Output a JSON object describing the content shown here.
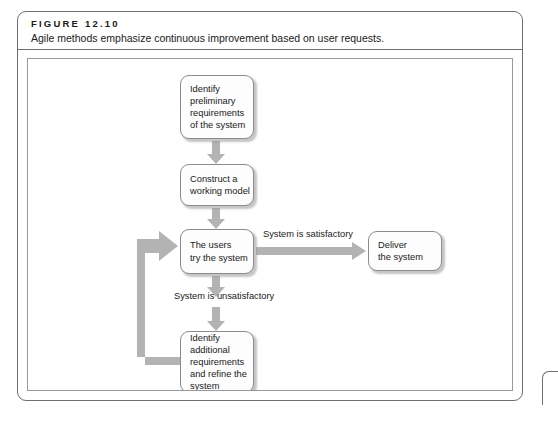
{
  "figure": {
    "number": "FIGURE 12.10",
    "caption": "Agile methods emphasize continuous improvement based on user requests."
  },
  "colors": {
    "frame_border": "#6e6e6e",
    "canvas_border": "#9a9a9a",
    "node_border": "#8c8c8c",
    "node_fill": "#fdfdfd",
    "arrow": "#b3b3b3",
    "text": "#1a1a1a"
  },
  "diagram": {
    "type": "flowchart",
    "nodes": [
      {
        "id": "identify-preliminary-requirements",
        "label": "Identify\npreliminary\nrequirements\nof the system"
      },
      {
        "id": "construct-working-model",
        "label": "Construct a\nworking model"
      },
      {
        "id": "users-try-system",
        "label": "The users\ntry the system"
      },
      {
        "id": "deliver-system",
        "label": "Deliver\nthe system"
      },
      {
        "id": "identify-additional-requirements",
        "label": "Identify\nadditional\nrequirements\nand refine the\nsystem"
      }
    ],
    "edges": [
      {
        "from": "identify-preliminary-requirements",
        "to": "construct-working-model",
        "label": ""
      },
      {
        "from": "construct-working-model",
        "to": "users-try-system",
        "label": ""
      },
      {
        "from": "users-try-system",
        "to": "deliver-system",
        "label": "System is satisfactory"
      },
      {
        "from": "users-try-system",
        "to": "identify-additional-requirements",
        "label": "System is unsatisfactory"
      },
      {
        "from": "identify-additional-requirements",
        "to": "users-try-system",
        "label": ""
      }
    ],
    "edge_labels": {
      "satisfactory": "System is satisfactory",
      "unsatisfactory": "System is unsatisfactory"
    }
  }
}
